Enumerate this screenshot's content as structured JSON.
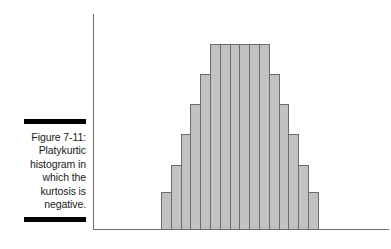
{
  "figure": {
    "label": "Figure 7-11:",
    "caption_lines": [
      "Platykurtic",
      "histogram in",
      "which the",
      "kurtosis is",
      "negative."
    ]
  },
  "colors": {
    "bar_fill": "#c2c2c2",
    "bar_border": "#6b6b6b",
    "axis": "#6e6e6e",
    "rule": "#000000",
    "text": "#1a1a1a",
    "background": "#ffffff"
  },
  "chart_data": {
    "type": "bar",
    "title": "",
    "subtitle": "",
    "xlabel": "",
    "ylabel": "",
    "grid": false,
    "legend": "none",
    "axis_ticks": false,
    "tick_labels": [],
    "annotations": [],
    "categories": [
      "1",
      "2",
      "3",
      "4",
      "5",
      "6",
      "7",
      "8",
      "9",
      "10",
      "11",
      "12",
      "13",
      "14",
      "15",
      "16"
    ],
    "values": [
      17,
      30,
      44,
      58,
      72,
      86,
      86,
      86,
      86,
      86,
      86,
      72,
      58,
      44,
      30,
      17
    ],
    "ylim": [
      0,
      100
    ],
    "xlim": [
      0,
      16
    ]
  }
}
